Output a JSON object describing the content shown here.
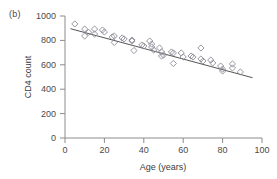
{
  "panel": {
    "label": "(b)"
  },
  "chart_data": {
    "type": "scatter",
    "title": "",
    "subtitle": "",
    "xlabel": "Age (years)",
    "ylabel": "CD4 count",
    "xlim": [
      0,
      100
    ],
    "ylim": [
      0,
      1000
    ],
    "xticks": [
      0,
      20,
      40,
      60,
      80,
      100
    ],
    "yticks": [
      0,
      200,
      400,
      600,
      800,
      1000
    ],
    "grid": false,
    "legend": null,
    "marker": "open-diamond",
    "marker_color": "#8a8a96",
    "line_color": "#555555",
    "series": [
      {
        "name": "CD4 count by age",
        "points": [
          [
            5,
            935
          ],
          [
            10,
            893
          ],
          [
            10,
            836
          ],
          [
            12,
            866
          ],
          [
            15,
            893
          ],
          [
            15,
            852
          ],
          [
            19,
            885
          ],
          [
            20,
            869
          ],
          [
            24,
            828
          ],
          [
            25,
            836
          ],
          [
            25,
            783
          ],
          [
            29,
            820
          ],
          [
            30,
            812
          ],
          [
            34,
            803
          ],
          [
            34,
            795
          ],
          [
            35,
            717
          ],
          [
            39,
            762
          ],
          [
            40,
            754
          ],
          [
            43,
            795
          ],
          [
            44,
            770
          ],
          [
            44,
            746
          ],
          [
            45,
            721
          ],
          [
            48,
            738
          ],
          [
            49,
            705
          ],
          [
            49,
            672
          ],
          [
            50,
            680
          ],
          [
            54,
            705
          ],
          [
            55,
            697
          ],
          [
            55,
            611
          ],
          [
            59,
            697
          ],
          [
            60,
            664
          ],
          [
            64,
            672
          ],
          [
            65,
            664
          ],
          [
            69,
            738
          ],
          [
            69,
            648
          ],
          [
            70,
            631
          ],
          [
            74,
            639
          ],
          [
            75,
            615
          ],
          [
            79,
            590
          ],
          [
            80,
            565
          ],
          [
            80,
            549
          ],
          [
            85,
            607
          ],
          [
            85,
            574
          ],
          [
            89,
            541
          ]
        ]
      }
    ],
    "fit_line": {
      "name": "least-squares fit",
      "x_start": 3,
      "y_start": 895,
      "x_end": 95,
      "y_end": 495
    }
  }
}
